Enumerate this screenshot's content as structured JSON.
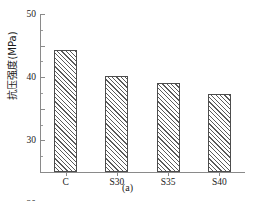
{
  "chart_data": {
    "type": "bar",
    "title": "",
    "subtitle": "",
    "caption": "(a)",
    "xlabel": "",
    "ylabel": "抗压强度(MPa)",
    "categories": [
      "C",
      "S30",
      "S35",
      "S40"
    ],
    "values": [
      38.5,
      30.3,
      28.2,
      24.8
    ],
    "series": [
      {
        "name": "抗压强度",
        "values": [
          38.5,
          30.3,
          28.2,
          24.8
        ]
      }
    ],
    "ylim": [
      0,
      50
    ],
    "yticks": [
      0,
      10,
      20,
      30,
      40,
      50
    ],
    "ytick_labels": [
      "0",
      "10",
      "20",
      "30",
      "40",
      "50"
    ],
    "yminor_ticks": [
      5,
      15,
      25,
      35,
      45
    ],
    "grid": false,
    "legend": false,
    "legend_position": "none",
    "bar_fill": "hatched-diagonal",
    "bar_edge_color": "#4d4d4d",
    "bar_hatch_color": "#5a5a5a",
    "axis_color": "#8a8a8a",
    "text_color": "#1a1a1a",
    "background": "#ffffff"
  }
}
